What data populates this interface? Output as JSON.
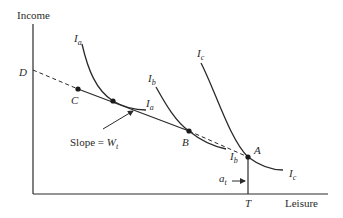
{
  "diagram": {
    "axes": {
      "y_label": "Income",
      "x_label": "Leisure",
      "x_tick_label": "T"
    },
    "points": [
      {
        "name": "D",
        "label": "D"
      },
      {
        "name": "C",
        "label": "C"
      },
      {
        "name": "B",
        "label": "B"
      },
      {
        "name": "A",
        "label": "A"
      }
    ],
    "curves": {
      "Ia": {
        "main": "I",
        "sub": "a"
      },
      "Ib": {
        "main": "I",
        "sub": "b"
      },
      "Ic": {
        "main": "I",
        "sub": "c"
      }
    },
    "annotations": {
      "slope_text": "Slope = ",
      "slope_var": "W",
      "slope_sub": "t",
      "at_main": "a",
      "at_sub": "t"
    },
    "colors": {
      "line": "#2a2a2a",
      "background": "#ffffff"
    }
  }
}
